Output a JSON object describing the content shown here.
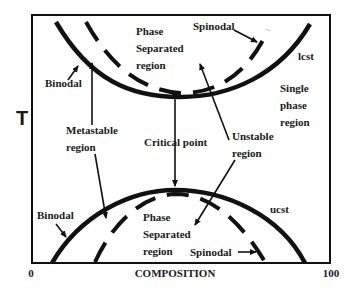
{
  "diagram": {
    "type": "phase-diagram",
    "axes": {
      "y_label": "T",
      "x_label": "COMPOSITION",
      "x_min_label": "0",
      "x_max_label": "100"
    },
    "upper_region": {
      "phase_separated_label": [
        "Phase",
        "Separated",
        "region"
      ],
      "spinodal_label": "Spinodal",
      "binodal_label": "Binodal",
      "critical_temperature_label": "lcst"
    },
    "lower_region": {
      "phase_separated_label": [
        "Phase",
        "Separated",
        "region"
      ],
      "spinodal_label": "Spinodal",
      "binodal_label": "Binodal",
      "critical_temperature_label": "ucst"
    },
    "middle_labels": {
      "single_phase": [
        "Single",
        "phase",
        "region"
      ],
      "metastable": [
        "Metastable",
        "region"
      ],
      "critical_point": "Critical point",
      "unstable": [
        "Unstable",
        "region"
      ]
    },
    "colors": {
      "ink": "#111111",
      "background": "#ffffff"
    }
  }
}
